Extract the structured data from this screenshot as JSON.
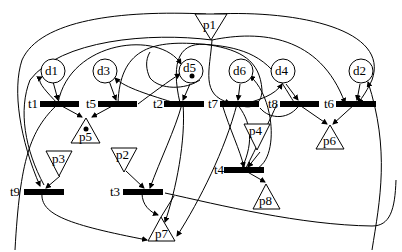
{
  "diagram": {
    "type": "petri-net",
    "colors": {
      "stroke": "#000000",
      "background": "#ffffff",
      "transition_fill": "#000000"
    },
    "circle_places": [
      {
        "id": "d1",
        "label": "d1",
        "tokens": 0
      },
      {
        "id": "d3",
        "label": "d3",
        "tokens": 0
      },
      {
        "id": "d5",
        "label": "d5",
        "tokens": 1
      },
      {
        "id": "d6",
        "label": "d6",
        "tokens": 0
      },
      {
        "id": "d4",
        "label": "d4",
        "tokens": 0
      },
      {
        "id": "d2",
        "label": "d2",
        "tokens": 0
      }
    ],
    "triangle_places": [
      {
        "id": "p1",
        "label": "p1",
        "orientation": "down",
        "tokens": 0
      },
      {
        "id": "p2",
        "label": "p2",
        "orientation": "down",
        "tokens": 0
      },
      {
        "id": "p3",
        "label": "p3",
        "orientation": "down",
        "tokens": 0
      },
      {
        "id": "p4",
        "label": "p4",
        "orientation": "down",
        "tokens": 0
      },
      {
        "id": "p5",
        "label": "p5",
        "orientation": "up",
        "tokens": 1
      },
      {
        "id": "p6",
        "label": "p6",
        "orientation": "up",
        "tokens": 0
      },
      {
        "id": "p7",
        "label": "p7",
        "orientation": "hourglass",
        "tokens": 0
      },
      {
        "id": "p8",
        "label": "p8",
        "orientation": "up",
        "tokens": 0
      }
    ],
    "transitions": [
      {
        "id": "t1",
        "label": "t1"
      },
      {
        "id": "t2",
        "label": "t2"
      },
      {
        "id": "t3",
        "label": "t3"
      },
      {
        "id": "t4",
        "label": "t4"
      },
      {
        "id": "t5",
        "label": "t5"
      },
      {
        "id": "t6",
        "label": "t6"
      },
      {
        "id": "t7",
        "label": "t7"
      },
      {
        "id": "t8",
        "label": "t8"
      },
      {
        "id": "t9",
        "label": "t9"
      }
    ]
  }
}
